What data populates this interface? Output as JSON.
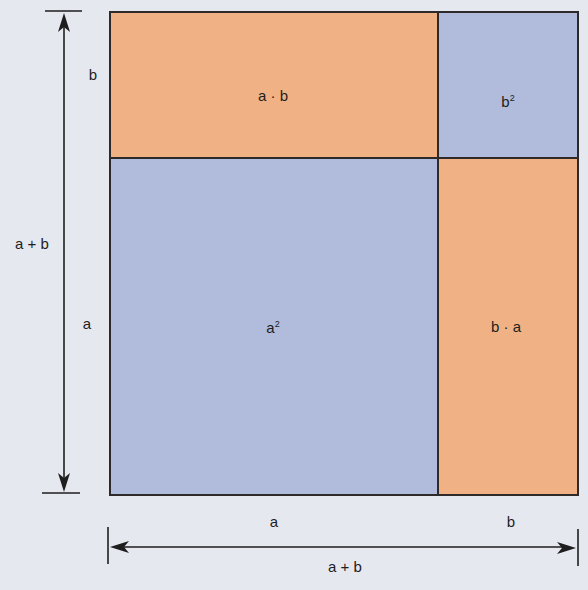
{
  "diagram": {
    "colors": {
      "background": "#e6e8ef",
      "orange": "#f0b284",
      "blue": "#b1bcdc",
      "stroke": "#2e2a2a"
    },
    "regions": [
      {
        "id": "top-left",
        "label": "a · b",
        "fill": "orange"
      },
      {
        "id": "top-right",
        "label_base": "b",
        "label_exp": "2",
        "fill": "blue"
      },
      {
        "id": "bottom-left",
        "label_base": "a",
        "label_exp": "2",
        "fill": "blue"
      },
      {
        "id": "bottom-right",
        "label": "b · a",
        "fill": "orange"
      }
    ],
    "left_dimension": {
      "segment_top": "b",
      "segment_bottom": "a",
      "total": "a + b"
    },
    "bottom_dimension": {
      "segment_left": "a",
      "segment_right": "b",
      "total": "a + b"
    }
  }
}
